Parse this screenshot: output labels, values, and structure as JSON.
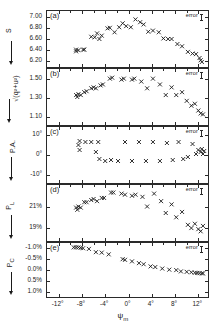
{
  "figure": {
    "xlabel": "ψ",
    "xlabel_sub": "m",
    "error_label": "error",
    "xticks": [
      "-12°",
      "-8°",
      "-4°",
      "0°",
      "4°",
      "8°",
      "12°"
    ],
    "xtick_values": [
      -12,
      -8,
      -4,
      0,
      4,
      8,
      12
    ],
    "xlim": [
      -14,
      14
    ],
    "marker": "x",
    "axis_color": "#2a2a2a",
    "marker_color": "#1a1a1a"
  },
  "chart_data": [
    {
      "type": "scatter",
      "panel": "(a)",
      "ylabel": "S",
      "title": "",
      "xlabel": "ψ_m",
      "yticks": [
        7.0,
        6.8,
        6.6,
        6.4,
        6.2
      ],
      "ytick_labels": [
        "7.00",
        "6.80",
        "6.60",
        "6.40",
        "6.20"
      ],
      "ylim": [
        6.1,
        7.1
      ],
      "xlim": [
        -14,
        14
      ],
      "grid": false,
      "x": [
        -9.0,
        -9.0,
        -8.6,
        -7.8,
        -7.6,
        -6.4,
        -5.8,
        -5.4,
        -5.0,
        -4.6,
        -3.6,
        -3.2,
        -2.4,
        -1.6,
        -1.0,
        -0.4,
        0.4,
        1.2,
        2.0,
        2.6,
        3.4,
        4.2,
        5.2,
        6.0,
        6.8,
        7.4,
        8.4,
        9.2,
        10.2,
        11.0,
        11.6,
        12.2,
        12.4,
        12.6
      ],
      "y": [
        6.41,
        6.38,
        6.4,
        6.41,
        6.41,
        6.64,
        6.63,
        6.7,
        6.6,
        6.66,
        6.79,
        6.8,
        6.72,
        6.81,
        6.88,
        6.83,
        6.81,
        6.95,
        6.9,
        6.86,
        6.73,
        6.75,
        6.72,
        6.61,
        6.6,
        6.6,
        6.51,
        6.47,
        6.37,
        6.34,
        6.33,
        6.26,
        6.22,
        6.19
      ]
    },
    {
      "type": "scatter",
      "panel": "(b)",
      "ylabel": "√(q²+u²)",
      "yticks": [
        1.5,
        1.3,
        1.1
      ],
      "ytick_labels": [
        "1.50",
        "1.30",
        "1.10"
      ],
      "ylim": [
        1.02,
        1.6
      ],
      "xlim": [
        -14,
        14
      ],
      "grid": false,
      "x": [
        -9.0,
        -8.8,
        -8.6,
        -8.2,
        -7.6,
        -7.2,
        -6.4,
        -6.0,
        -5.6,
        -4.8,
        -4.4,
        -3.2,
        -2.8,
        -1.2,
        -0.8,
        0.6,
        1.0,
        2.2,
        3.2,
        4.2,
        5.4,
        6.4,
        7.4,
        8.2,
        9.2,
        10.0,
        10.8,
        11.4,
        12.0,
        12.4,
        12.8
      ],
      "y": [
        1.33,
        1.31,
        1.34,
        1.33,
        1.36,
        1.37,
        1.4,
        1.41,
        1.4,
        1.43,
        1.44,
        1.5,
        1.51,
        1.49,
        1.5,
        1.49,
        1.5,
        1.47,
        1.4,
        1.5,
        1.44,
        1.33,
        1.41,
        1.33,
        1.36,
        1.27,
        1.22,
        1.24,
        1.17,
        1.14,
        1.13
      ]
    },
    {
      "type": "scatter",
      "panel": "(c)",
      "ylabel": "P.A.",
      "yticks": [
        10,
        0,
        -10
      ],
      "ytick_labels": [
        "10°",
        "0°",
        "-10°"
      ],
      "ylim": [
        -14,
        14
      ],
      "xlim": [
        -14,
        14
      ],
      "grid": false,
      "x": [
        -8.6,
        -8.4,
        -8.4,
        -7.4,
        -6.4,
        -5.6,
        -5.2,
        -5.0,
        -4.0,
        -3.0,
        -1.8,
        -0.6,
        0.6,
        1.8,
        3.0,
        4.2,
        5.4,
        6.6,
        7.6,
        8.6,
        9.4,
        10.2,
        11.0,
        11.6,
        12.0,
        12.4,
        12.6,
        12.8,
        13.0
      ],
      "y": [
        5.0,
        7.0,
        2.5,
        6.5,
        6.5,
        1.5,
        6.5,
        -2.0,
        -3.0,
        -2.5,
        -3.0,
        6.5,
        -3.0,
        6.5,
        -3.0,
        6.5,
        -3.0,
        6.0,
        -2.5,
        6.5,
        -2.0,
        -1.0,
        5.5,
        0.5,
        2.5,
        1.5,
        3.0,
        0.5,
        2.0
      ]
    },
    {
      "type": "scatter",
      "panel": "(d)",
      "ylabel": "P_L",
      "yticks": [
        21,
        19
      ],
      "ytick_labels": [
        "21%",
        "19%"
      ],
      "ylim": [
        17.8,
        23.0
      ],
      "xlim": [
        -14,
        14
      ],
      "grid": false,
      "x": [
        -9.0,
        -8.8,
        -8.6,
        -8.2,
        -7.6,
        -7.2,
        -6.4,
        -6.0,
        -5.4,
        -4.6,
        -4.2,
        -3.0,
        -2.6,
        -1.2,
        -0.6,
        0.6,
        1.2,
        2.4,
        3.2,
        4.4,
        5.6,
        6.4,
        7.4,
        8.2,
        9.2,
        10.2,
        10.8,
        11.4,
        12.0,
        12.4,
        12.8
      ],
      "y": [
        20.9,
        20.7,
        21.0,
        20.9,
        21.4,
        21.4,
        21.6,
        21.7,
        21.5,
        21.8,
        21.8,
        22.3,
        22.3,
        22.2,
        22.1,
        22.0,
        22.1,
        21.9,
        21.0,
        22.2,
        21.5,
        20.4,
        21.2,
        20.0,
        20.5,
        19.3,
        19.0,
        19.4,
        18.9,
        18.7,
        19.2
      ]
    },
    {
      "type": "scatter",
      "panel": "(e)",
      "ylabel": "P_C",
      "yticks": [
        -1.0,
        -0.5,
        0.0,
        0.5,
        1.0
      ],
      "ytick_labels": [
        "-1.0%",
        "-0.5%",
        "0.0%",
        "0.5%",
        "1.0%"
      ],
      "ylim": [
        -1.22,
        1.25
      ],
      "y_inverted": true,
      "xlim": [
        -14,
        14
      ],
      "grid": false,
      "x": [
        -9.4,
        -9.0,
        -8.6,
        -8.2,
        -7.8,
        -6.8,
        -5.6,
        -4.6,
        -3.4,
        -1.0,
        -0.6,
        0.6,
        1.8,
        2.6,
        3.8,
        4.6,
        5.8,
        7.0,
        8.2,
        9.0,
        10.0,
        10.8,
        11.4,
        11.8,
        12.2,
        12.6,
        12.8
      ],
      "y": [
        -1.02,
        -1.02,
        -1.02,
        -1.0,
        -0.98,
        -0.95,
        -0.8,
        -0.78,
        -0.7,
        -0.48,
        -0.45,
        -0.38,
        -0.3,
        -0.25,
        -0.15,
        -0.12,
        -0.05,
        0.0,
        0.02,
        0.08,
        0.1,
        0.12,
        0.14,
        0.15,
        0.16,
        0.17,
        0.17
      ]
    }
  ]
}
